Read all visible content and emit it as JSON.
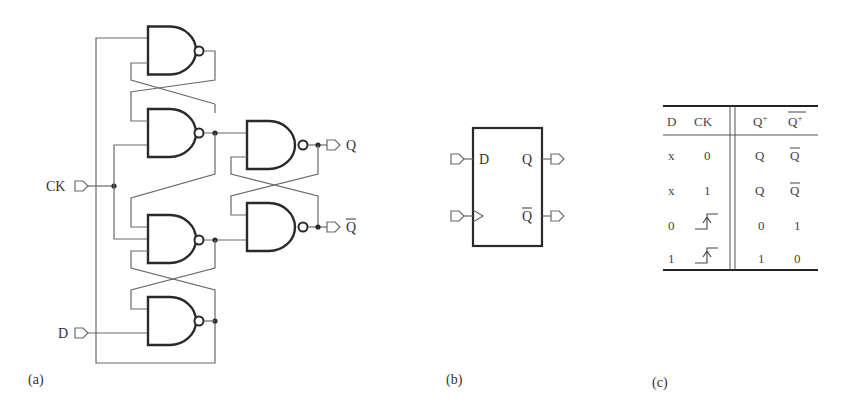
{
  "figure": {
    "panels": [
      {
        "id": "a",
        "caption": "(a)",
        "description": "Edge-triggered D flip-flop built from six NAND gates"
      },
      {
        "id": "b",
        "caption": "(b)",
        "description": "D flip-flop symbol"
      },
      {
        "id": "c",
        "caption": "(c)",
        "description": "Characteristic table"
      }
    ]
  },
  "circuit": {
    "inputs": {
      "clock": "CK",
      "data": "D"
    },
    "outputs": {
      "q": "Q",
      "q_bar": "Q"
    },
    "gate_type": "NAND",
    "gate_count": 6
  },
  "symbol": {
    "pins": {
      "d": "D",
      "q": "Q",
      "q_bar": "Q"
    }
  },
  "table": {
    "headers": [
      "D",
      "CK",
      "Q+",
      "Q+bar"
    ],
    "header_display": {
      "d": "D",
      "ck": "CK",
      "q": "Q",
      "q_sup": "+",
      "qbar": "Q",
      "qbar_sup": "+"
    },
    "rows": [
      {
        "d": "x",
        "ck": "0",
        "q": "Q",
        "qbar": "Q̄"
      },
      {
        "d": "x",
        "ck": "1",
        "q": "Q",
        "qbar": "Q̄"
      },
      {
        "d": "0",
        "ck": "rising-edge",
        "q": "0",
        "qbar": "1"
      },
      {
        "d": "1",
        "ck": "rising-edge",
        "q": "1",
        "qbar": "0"
      }
    ],
    "cells": {
      "r0": {
        "d": "x",
        "ck": "0",
        "q": "Q",
        "qbar": "Q"
      },
      "r1": {
        "d": "x",
        "ck": "1",
        "q": "Q",
        "qbar": "Q"
      },
      "r2": {
        "d": "0",
        "q": "0",
        "qbar": "1"
      },
      "r3": {
        "d": "1",
        "q": "1",
        "qbar": "0"
      }
    }
  }
}
